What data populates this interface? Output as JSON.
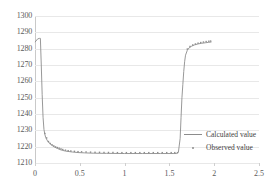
{
  "chart_data": {
    "type": "line",
    "title": "",
    "xlabel": "",
    "ylabel": "",
    "xlim": [
      0,
      2.5
    ],
    "ylim": [
      1210,
      1300
    ],
    "xticks": [
      "0",
      "0.5",
      "1",
      "1.5",
      "2",
      "2.5"
    ],
    "yticks": [
      "1300",
      "1290",
      "1280",
      "1270",
      "1260",
      "1250",
      "1240",
      "1230",
      "1220",
      "1210"
    ],
    "grid": true,
    "legend_position": "inside-right-lower",
    "series": [
      {
        "name": "Calculated value",
        "marker": "line",
        "color": "#8c8c8c",
        "x": [
          0.0,
          0.03,
          0.05,
          0.06,
          0.07,
          0.08,
          0.09,
          0.1,
          0.11,
          0.12,
          0.14,
          0.16,
          0.18,
          0.2,
          0.22,
          0.25,
          0.28,
          0.31,
          0.34,
          0.38,
          0.42,
          0.48,
          0.55,
          0.65,
          0.8,
          1.0,
          1.2,
          1.4,
          1.55,
          1.58,
          1.6,
          1.62,
          1.63,
          1.64,
          1.65,
          1.66,
          1.67,
          1.68,
          1.7,
          1.72,
          1.75,
          1.78,
          1.82,
          1.86,
          1.9,
          1.94,
          1.97
        ],
        "y": [
          1284.0,
          1286.0,
          1286.3,
          1286.3,
          1270.0,
          1252.0,
          1238.0,
          1230.5,
          1227.5,
          1225.5,
          1223.5,
          1222.2,
          1221.2,
          1220.4,
          1219.7,
          1218.9,
          1218.2,
          1217.7,
          1217.3,
          1217.0,
          1216.7,
          1216.4,
          1216.2,
          1216.0,
          1215.9,
          1215.8,
          1215.8,
          1215.8,
          1215.8,
          1215.8,
          1216.5,
          1225.0,
          1238.0,
          1250.0,
          1258.0,
          1266.0,
          1272.0,
          1276.0,
          1279.0,
          1280.5,
          1281.6,
          1282.3,
          1282.9,
          1283.3,
          1283.6,
          1283.9,
          1284.1
        ]
      },
      {
        "name": "Observed value",
        "marker": "dot",
        "color": "#8c8c8c",
        "x": [
          0.11,
          0.13,
          0.15,
          0.17,
          0.19,
          0.21,
          0.23,
          0.25,
          0.27,
          0.29,
          0.31,
          0.34,
          0.37,
          0.4,
          0.44,
          0.48,
          0.52,
          0.57,
          0.62,
          0.67,
          0.72,
          0.77,
          0.82,
          0.87,
          0.92,
          0.97,
          1.02,
          1.07,
          1.12,
          1.17,
          1.22,
          1.27,
          1.32,
          1.37,
          1.42,
          1.47,
          1.52,
          1.56,
          1.59,
          1.7,
          1.73,
          1.76,
          1.79,
          1.82,
          1.85,
          1.88,
          1.91,
          1.94,
          1.96
        ],
        "y": [
          1227.5,
          1224.8,
          1222.6,
          1221.4,
          1220.6,
          1219.9,
          1219.3,
          1218.9,
          1218.5,
          1218.1,
          1217.7,
          1217.3,
          1217.0,
          1216.8,
          1216.6,
          1216.4,
          1216.3,
          1216.2,
          1216.1,
          1216.0,
          1216.0,
          1215.9,
          1215.9,
          1215.9,
          1215.8,
          1215.8,
          1215.8,
          1215.8,
          1215.8,
          1215.8,
          1215.8,
          1215.8,
          1215.8,
          1215.8,
          1215.8,
          1215.8,
          1215.8,
          1215.8,
          1215.8,
          1279.2,
          1280.8,
          1281.7,
          1282.3,
          1282.8,
          1283.2,
          1283.5,
          1283.8,
          1284.0,
          1284.1
        ]
      }
    ],
    "legend": [
      {
        "label": "Calculated value",
        "marker": "line"
      },
      {
        "label": "Observed value",
        "marker": "dot"
      }
    ],
    "colors": {
      "line": "#8c8c8c",
      "grid": "#e8e8e8",
      "axis": "#bdbdbd",
      "text": "#5a5a5a",
      "background": "#ffffff"
    }
  }
}
